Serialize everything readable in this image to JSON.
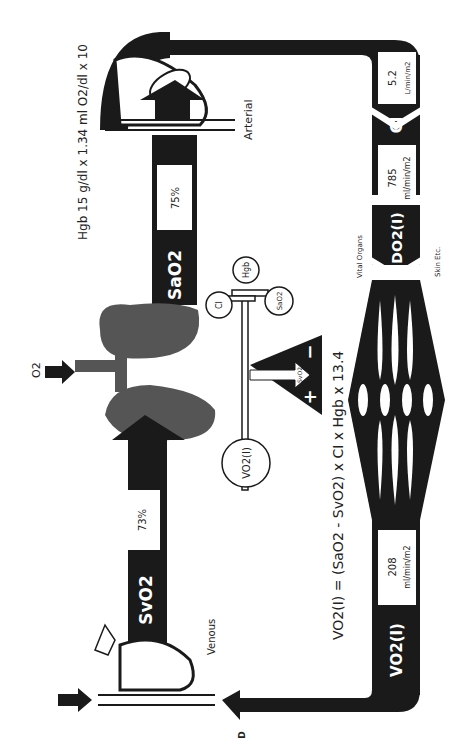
{
  "diagram": {
    "title_formula": "VO2(I) = (SaO2 - SvO2) x CI x Hgb x 13.4",
    "formula_parts": {
      "lhs": "VO",
      "lhs_sub": "2",
      "lhs_tail": "(I) = (SaO",
      "sa_sub": "2",
      "mid": " -SvO",
      "sv_sub": "2",
      "rhs": ") x CI x Hgb x 13.4"
    },
    "hgb_note": "Hgb 15 g/dl x 1.34 ml O2/dl x 10",
    "o2_label": "O2",
    "labels": {
      "arterial": "Arterial",
      "venous": "Venous",
      "vital_organs": "Vital Organs",
      "skin": "Skin Etc.",
      "panel_letter": "D"
    },
    "bars": {
      "sao2": {
        "label": "SaO2",
        "value": "75%"
      },
      "svo2": {
        "label": "SvO2",
        "value": "73%"
      },
      "ci": {
        "label": "CI",
        "value": "5.2",
        "unit": "L/min/m2"
      },
      "do2": {
        "label": "DO2(I)",
        "value": "785",
        "unit": "ml/min/m2"
      },
      "vo2": {
        "label": "VO2(I)",
        "value": "208",
        "unit": "ml/min/m2"
      }
    },
    "balance": {
      "circles": [
        "CI",
        "Hgb",
        "SaO2",
        "VO2(I)"
      ],
      "fulcrum_label": "SvO2",
      "plus": "+",
      "minus": "−"
    }
  }
}
